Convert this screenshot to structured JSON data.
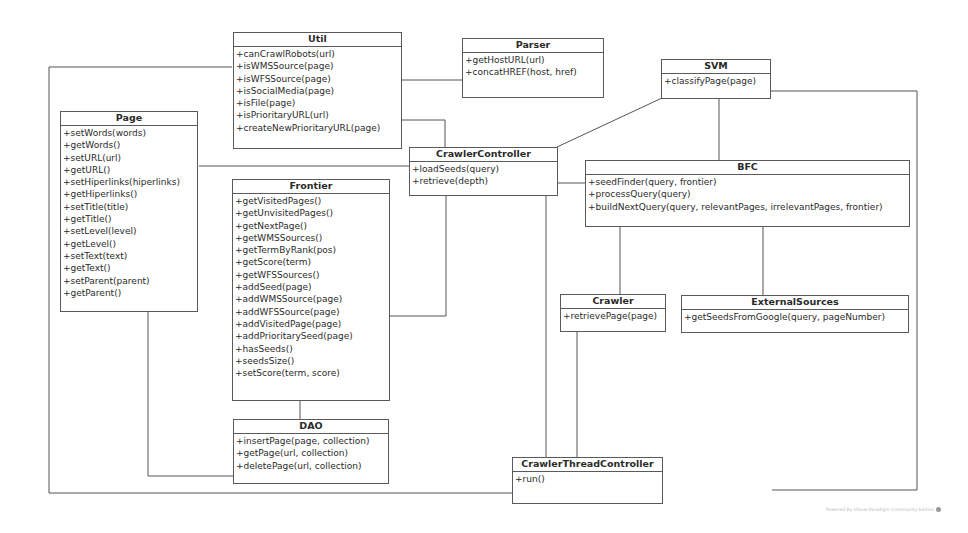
{
  "diagram": {
    "type": "UML class diagram",
    "classes": {
      "util": {
        "name": "Util",
        "operations": [
          "+canCrawlRobots(url)",
          "+isWMSSource(page)",
          "+isWFSSource(page)",
          "+isSocialMedia(page)",
          "+isFile(page)",
          "+isPrioritaryURL(url)",
          "+createNewPrioritaryURL(page)"
        ]
      },
      "parser": {
        "name": "Parser",
        "operations": [
          "+getHostURL(url)",
          "+concatHREF(host, href)"
        ]
      },
      "svm": {
        "name": "SVM",
        "operations": [
          "+classifyPage(page)"
        ]
      },
      "page": {
        "name": "Page",
        "operations": [
          "+setWords(words)",
          "+getWords()",
          "+setURL(url)",
          "+getURL()",
          "+setHiperlinks(hiperlinks)",
          "+getHiperlinks()",
          "+setTitle(title)",
          "+getTitle()",
          "+setLevel(level)",
          "+getLevel()",
          "+setText(text)",
          "+getText()",
          "+setParent(parent)",
          "+getParent()"
        ]
      },
      "crawler_controller": {
        "name": "CrawlerController",
        "operations": [
          "+loadSeeds(query)",
          "+retrieve(depth)"
        ]
      },
      "frontier": {
        "name": "Frontier",
        "operations": [
          "+getVisitedPages()",
          "+getUnvisitedPages()",
          "+getNextPage()",
          "+getWMSSources()",
          "+getTermByRank(pos)",
          "+getScore(term)",
          "+getWFSSources()",
          "+addSeed(page)",
          "+addWMSSource(page)",
          "+addWFSSource(page)",
          "+addVisitedPage(page)",
          "+addPrioritarySeed(page)",
          "+hasSeeds()",
          "+seedsSize()",
          "+setScore(term, score)"
        ]
      },
      "bfc": {
        "name": "BFC",
        "operations": [
          "+seedFinder(query, frontier)",
          "+processQuery(query)",
          "+buildNextQuery(query, relevantPages, irrelevantPages, frontier)"
        ]
      },
      "crawler": {
        "name": "Crawler",
        "operations": [
          "+retrievePage(page)"
        ]
      },
      "external_sources": {
        "name": "ExternalSources",
        "operations": [
          "+getSeedsFromGoogle(query, pageNumber)"
        ]
      },
      "dao": {
        "name": "DAO",
        "operations": [
          "+insertPage(page, collection)",
          "+getPage(url, collection)",
          "+deletePage(url, collection)"
        ]
      },
      "crawler_thread_controller": {
        "name": "CrawlerThreadController",
        "operations": [
          "+run()"
        ]
      }
    },
    "associations": [
      [
        "Util",
        "Parser"
      ],
      [
        "Util",
        "CrawlerController"
      ],
      [
        "Util",
        "CrawlerThreadController"
      ],
      [
        "SVM",
        "CrawlerController"
      ],
      [
        "SVM",
        "BFC"
      ],
      [
        "SVM",
        "CrawlerThreadController"
      ],
      [
        "Page",
        "CrawlerController"
      ],
      [
        "Page",
        "DAO"
      ],
      [
        "Frontier",
        "CrawlerController"
      ],
      [
        "Frontier",
        "DAO"
      ],
      [
        "CrawlerController",
        "BFC"
      ],
      [
        "CrawlerController",
        "CrawlerThreadController"
      ],
      [
        "BFC",
        "Crawler"
      ],
      [
        "BFC",
        "ExternalSources"
      ],
      [
        "Crawler",
        "CrawlerThreadController"
      ]
    ]
  },
  "watermark": "Powered By Visual Paradigm Community Edition"
}
